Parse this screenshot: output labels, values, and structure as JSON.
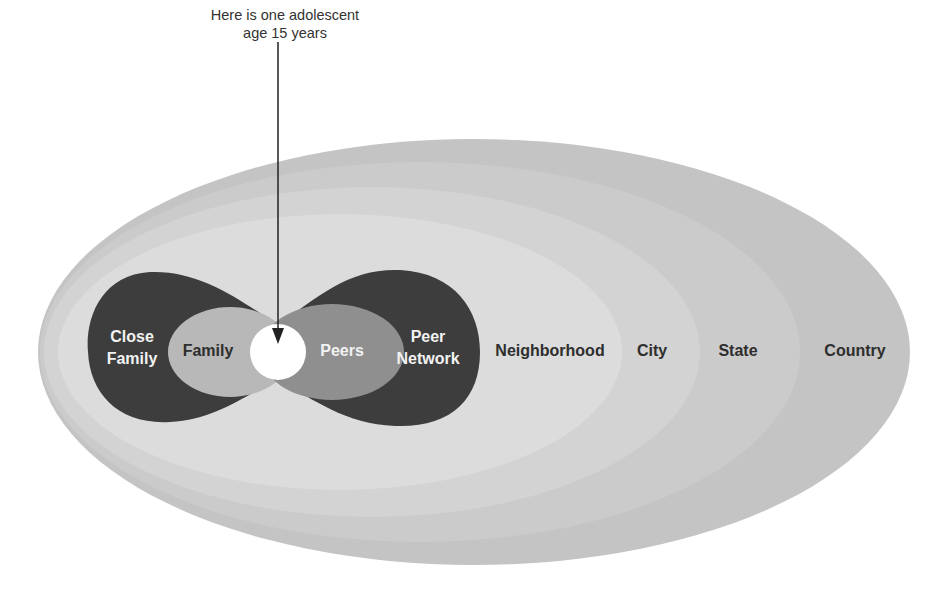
{
  "annotation": {
    "line1": "Here is one adolescent",
    "line2": "age 15 years"
  },
  "layers": [
    {
      "id": "country",
      "label": "Country",
      "color": "#c4c4c4"
    },
    {
      "id": "state",
      "label": "State",
      "color": "#cbcbcb"
    },
    {
      "id": "city",
      "label": "City",
      "color": "#d3d3d3"
    },
    {
      "id": "neighborhood",
      "label": "Neighborhood",
      "color": "#dcdcdc"
    },
    {
      "id": "close-family",
      "label_line1": "Close",
      "label_line2": "Family",
      "color": "#3d3d3d"
    },
    {
      "id": "family",
      "label": "Family",
      "color": "#b8b8b8"
    },
    {
      "id": "peer-network",
      "label_line1": "Peer",
      "label_line2": "Network",
      "color": "#3d3d3d"
    },
    {
      "id": "peers",
      "label": "Peers",
      "color": "#8f8f8f"
    },
    {
      "id": "adolescent",
      "label": "",
      "color": "#ffffff"
    }
  ],
  "colors": {
    "background": "#ffffff",
    "arrow": "#222222",
    "text_dark": "#2e2e2e",
    "text_light": "#f2f2f2"
  }
}
